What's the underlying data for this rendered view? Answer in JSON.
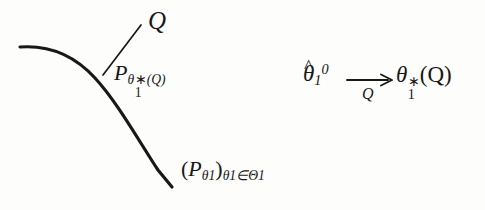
{
  "figure": {
    "background_color": "#fdfdfc",
    "ink_color": "#181818",
    "curve": {
      "name": "statistical-model-curve",
      "description": "smooth concave curve bending from upper-left down to lower-right",
      "stroke_width": 3.2,
      "points": [
        [
          20,
          47
        ],
        [
          70,
          52
        ],
        [
          110,
          78
        ],
        [
          145,
          134
        ],
        [
          172,
          186
        ]
      ]
    },
    "leader_line": {
      "name": "projection-leader-line",
      "from": [
        104,
        74
      ],
      "to": [
        141,
        25
      ],
      "stroke_width": 1.6
    },
    "arrow": {
      "name": "convergence-arrow",
      "x1": 347,
      "x2": 391,
      "y": 80,
      "stroke_width": 1.8
    }
  },
  "labels": {
    "q_point": {
      "text": "Q"
    },
    "projection": {
      "p": "P",
      "theta": "θ",
      "star": "∗",
      "one": "1",
      "arg": "(Q)"
    },
    "family": {
      "open_paren": "(",
      "p": "P",
      "theta": "θ",
      "one": "1",
      "close_paren": ")",
      "index_theta": "θ",
      "index_one": "1",
      "member_of": "∈",
      "big_theta": "Θ",
      "big_theta_one": "1"
    },
    "estimator": {
      "theta": "θ",
      "hat": "^",
      "one": "1",
      "zero": "0"
    },
    "arrow_subscript": {
      "text": "Q"
    },
    "limit": {
      "theta": "θ",
      "star": "∗",
      "one": "1",
      "arg": "(Q)"
    }
  }
}
